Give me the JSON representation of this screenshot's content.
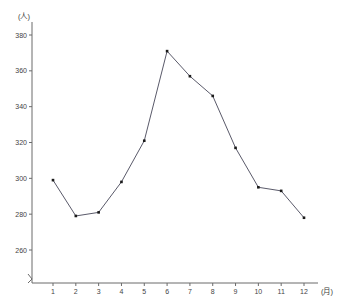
{
  "chart_data": {
    "type": "line",
    "title": "",
    "xlabel": "(月)",
    "ylabel": "(人)",
    "categories": [
      "1",
      "2",
      "3",
      "4",
      "5",
      "6",
      "7",
      "8",
      "9",
      "10",
      "11",
      "12"
    ],
    "values": [
      299,
      279,
      281,
      298,
      321,
      371,
      357,
      346,
      317,
      295,
      293,
      278
    ],
    "series": [
      {
        "name": "",
        "values": [
          299,
          279,
          281,
          298,
          321,
          371,
          357,
          346,
          317,
          295,
          293,
          278
        ]
      }
    ],
    "ylim": [
      250,
      385
    ],
    "y_ticks": [
      260,
      280,
      300,
      320,
      340,
      360,
      380
    ],
    "x_ticks": [
      "1",
      "2",
      "3",
      "4",
      "5",
      "6",
      "7",
      "8",
      "9",
      "10",
      "11",
      "12"
    ],
    "grid": false,
    "legend": false,
    "legend_position": "none",
    "line_color": "#5a5a6a",
    "marker_color": "#1a1a1a",
    "axis_color": "#6b6b6b",
    "background_color": "#ffffff"
  },
  "axes": {
    "y_unit_label": "(人)",
    "x_unit_label": "(月)"
  }
}
